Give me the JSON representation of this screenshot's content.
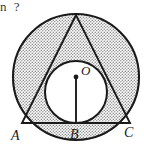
{
  "page": {
    "width": 144,
    "height": 157,
    "background": "#ffffff"
  },
  "question_fragment": {
    "text": "n ?"
  },
  "figure": {
    "kind": "geometry-diagram",
    "stroke_color": "#1a1a1a",
    "shade_color": "#c9c9c9",
    "shade_pattern": "stipple-dots",
    "unshaded_color": "#ffffff",
    "outer_circle": {
      "name": "circumcircle",
      "cx": 76,
      "cy": 77,
      "r": 63,
      "shaded": true
    },
    "inner_circle": {
      "name": "incircle",
      "cx": 76,
      "cy": 92,
      "r": 31,
      "shaded": false
    },
    "triangle": {
      "name": "equilateral-triangle",
      "vertices": [
        {
          "label": "apex",
          "x": 76,
          "y": 15
        },
        {
          "label": "A",
          "x": 22,
          "y": 123
        },
        {
          "label": "C",
          "x": 130,
          "y": 123
        }
      ]
    },
    "radius_segment": {
      "name": "segment-OB",
      "from": {
        "x": 76,
        "y": 77
      },
      "to": {
        "x": 76,
        "y": 123
      }
    },
    "center_dot": {
      "x": 76,
      "y": 77,
      "r": 2.4
    },
    "labels": [
      {
        "id": "O",
        "text": "O",
        "x": 81,
        "y": 75,
        "anchor": "start"
      },
      {
        "id": "A",
        "text": "A",
        "x": 11,
        "y": 140,
        "anchor": "start"
      },
      {
        "id": "B",
        "text": "B",
        "x": 70,
        "y": 139,
        "anchor": "start"
      },
      {
        "id": "C",
        "text": "C",
        "x": 124,
        "y": 137,
        "anchor": "start"
      }
    ]
  }
}
